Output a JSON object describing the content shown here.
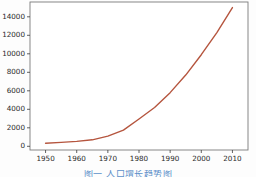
{
  "figure": {
    "background_color": "#fdfdfd",
    "axes_background_color": "#ffffff",
    "spine_color": "#7a7a7a",
    "tick_color": "#3a3a3a"
  },
  "caption": {
    "text": "图一 人口增长趋势图",
    "color": "#5b8fc9"
  },
  "chart_data": {
    "type": "line",
    "title": "",
    "xlabel": "",
    "ylabel": "",
    "xlim": [
      1945,
      2015
    ],
    "ylim": [
      -400,
      15600
    ],
    "grid": false,
    "legend": false,
    "line_color": "#b5553e",
    "line_width": 1.4,
    "xticks": [
      1950,
      1960,
      1970,
      1980,
      1990,
      2000,
      2010
    ],
    "xtick_labels": [
      "1950",
      "1960",
      "1970",
      "1980",
      "1990",
      "2000",
      "2010"
    ],
    "yticks": [
      0,
      2000,
      4000,
      6000,
      8000,
      10000,
      12000,
      14000
    ],
    "ytick_labels": [
      "0",
      "2000",
      "4000",
      "6000",
      "8000",
      "10000",
      "12000",
      "14000"
    ],
    "x": [
      1950,
      1955,
      1960,
      1965,
      1970,
      1975,
      1980,
      1985,
      1990,
      1995,
      2000,
      2005,
      2010
    ],
    "values": [
      330,
      420,
      530,
      700,
      1100,
      1750,
      2950,
      4200,
      5800,
      7700,
      9900,
      12300,
      15000
    ],
    "series": [
      {
        "name": "series-1",
        "values": [
          330,
          420,
          530,
          700,
          1100,
          1750,
          2950,
          4200,
          5800,
          7700,
          9900,
          12300,
          15000
        ]
      }
    ]
  }
}
